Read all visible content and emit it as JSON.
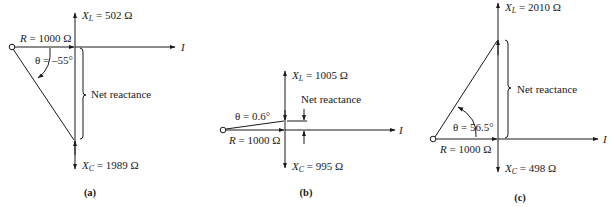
{
  "figures": [
    {
      "id": "a",
      "caption": "(a)",
      "xl_label": "X",
      "xl_sub": "L",
      "xl_value": " = 502 Ω",
      "xc_label": "X",
      "xc_sub": "C",
      "xc_value": " = 1989 Ω",
      "r_label": "R",
      "r_value": " = 1000 Ω",
      "theta": "θ = –55°",
      "net": "Net reactance",
      "current": "I"
    },
    {
      "id": "b",
      "caption": "(b)",
      "xl_label": "X",
      "xl_sub": "L",
      "xl_value": " = 1005 Ω",
      "xc_label": "X",
      "xc_sub": "C",
      "xc_value": " = 995 Ω",
      "r_label": "R",
      "r_value": " = 1000 Ω",
      "theta": "θ = 0.6°",
      "net": "Net reactance",
      "current": "I"
    },
    {
      "id": "c",
      "caption": "(c)",
      "xl_label": "X",
      "xl_sub": "L",
      "xl_value": " = 2010 Ω",
      "xc_label": "X",
      "xc_sub": "C",
      "xc_value": " = 498 Ω",
      "r_label": "R",
      "r_value": " = 1000 Ω",
      "theta": "θ = 56.5°",
      "net": "Net reactance",
      "current": "I"
    }
  ]
}
